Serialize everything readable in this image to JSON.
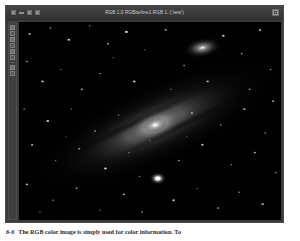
{
  "window": {
    "title": "RGB 1.0 RGBbefore1.RGB 1..('new')",
    "controls": [
      {
        "name": "close-button",
        "glyph": "x"
      },
      {
        "name": "minimize-button",
        "glyph": "-"
      },
      {
        "name": "restore-button",
        "glyph": "o"
      },
      {
        "name": "menu-button",
        "glyph": "="
      }
    ],
    "maximize_label": "maximize"
  },
  "toolbar": {
    "items": [
      {
        "name": "tool-pointer"
      },
      {
        "name": "tool-zoom"
      },
      {
        "name": "tool-crop"
      },
      {
        "name": "tool-pan"
      },
      {
        "name": "tool-measure"
      },
      {
        "name": "tool-levels"
      },
      {
        "name": "tool-curves"
      },
      {
        "name": "tool-info"
      }
    ]
  },
  "canvas": {
    "name": "astronomy-image",
    "description": "Grayscale astrophotograph of the Andromeda Galaxy",
    "background_color": "#000000",
    "objects": [
      {
        "name": "galaxy-core",
        "label": "M31 core",
        "x": 52,
        "y": 52
      },
      {
        "name": "companion-galaxy",
        "label": "M110",
        "x": 70,
        "y": 13
      },
      {
        "name": "bright-star",
        "label": "foreground star",
        "x": 53,
        "y": 79
      }
    ]
  },
  "caption": {
    "figure_number": "6-6",
    "text": "The RGB color image is simply used for color information. To"
  },
  "colors": {
    "window_frame": "#3b3b3b",
    "title_bar": "#3a3a3a",
    "title_text": "#cfcfcf",
    "canvas": "#000000",
    "page": "#ffffff",
    "caption_text": "#2a2a2a"
  }
}
